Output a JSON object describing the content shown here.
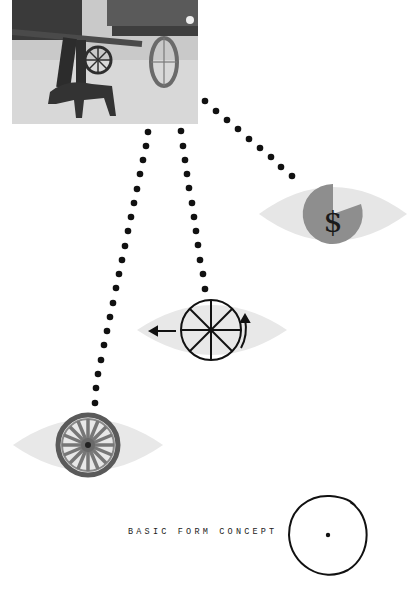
{
  "figure": {
    "photo": {
      "subject": "horse-drawn cart with dog (photograph)"
    },
    "eyes": [
      {
        "id": "money-eye",
        "icon": "dollar-pie-icon",
        "meaning": "money"
      },
      {
        "id": "motion-eye",
        "icon": "spoked-wheel-arrow-icon",
        "meaning": "motion / rotation"
      },
      {
        "id": "wheel-eye",
        "icon": "wagon-wheel-icon",
        "meaning": "wheel object"
      }
    ],
    "dollar_sign": "$",
    "basic_form": {
      "label": "BASIC FORM CONCEPT"
    }
  },
  "colors": {
    "eye_fill": "#e8e8e8",
    "pie_fill": "#8e8e8e",
    "ink": "#111111",
    "wheel_wood": "#7a7a7a"
  }
}
